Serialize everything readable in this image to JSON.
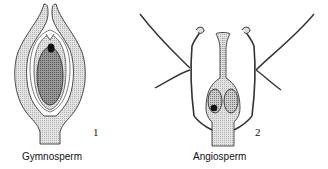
{
  "figure": {
    "panels": [
      {
        "number": "1",
        "caption": "Gymnosperm"
      },
      {
        "number": "2",
        "caption": "Angiosperm"
      }
    ]
  },
  "colors": {
    "outline": "#222222",
    "light_fill": "#d6d6d6",
    "dark_fill": "#8a8a8a",
    "black": "#111111"
  }
}
